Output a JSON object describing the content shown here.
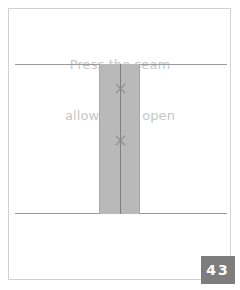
{
  "page": {
    "background_color": "#ffffff",
    "border_color": "#d2d2d2",
    "page_number": "43",
    "badge_color": "#7d7d7d",
    "badge_text_color": "#ffffff"
  },
  "caption": {
    "line1": "Press the seam",
    "line2": "allowances open",
    "color": "#c6c6c6"
  },
  "illustration": {
    "name": "pressed-seam-allowance-diagram",
    "fabric_color": "#b9b9b9",
    "line_color": "#9a9a9a",
    "seam_color": "#7f7f7f",
    "stitch_color": "#8a8a8a",
    "parts": [
      {
        "id": "fabric-line-top",
        "label": "upper fabric edge"
      },
      {
        "id": "fabric-line-bottom",
        "label": "lower fabric edge"
      },
      {
        "id": "seam-band",
        "label": "seam allowance band"
      },
      {
        "id": "seam-line",
        "label": "seam stitch line"
      },
      {
        "id": "stitch-mark-upper",
        "label": "press mark upper"
      },
      {
        "id": "stitch-mark-lower",
        "label": "press mark lower"
      }
    ]
  }
}
